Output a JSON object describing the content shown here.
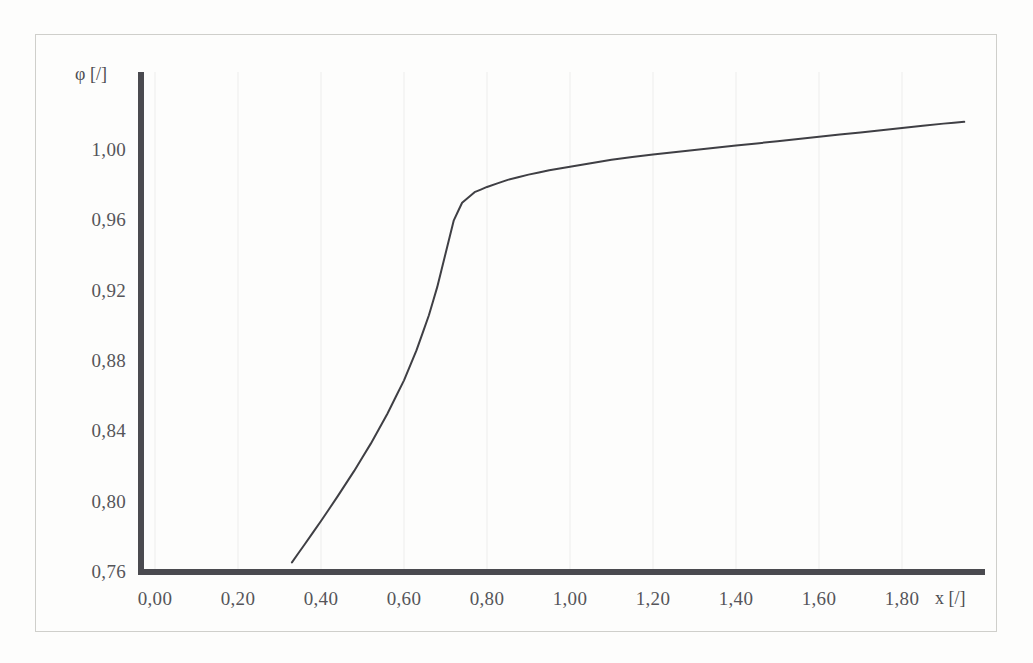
{
  "figure": {
    "background_color": "#fdfdfc",
    "frame_color": "#cfcfcb",
    "axis_color": "#4a4a4f",
    "curve_color": "#3f3f44",
    "gridline_color": "#f0f0ee",
    "tick_label_color": "#55555a"
  },
  "chart_data": {
    "type": "line",
    "title": "",
    "subtitle": "",
    "xlabel": "x [/]",
    "ylabel": "φ [/]",
    "xlim": [
      0.0,
      1.98
    ],
    "ylim": [
      0.76,
      1.025
    ],
    "grid": "vertical-only",
    "legend": "none",
    "x_ticks": [
      0.0,
      0.2,
      0.4,
      0.6,
      0.8,
      1.0,
      1.2,
      1.4,
      1.6,
      1.8
    ],
    "x_tick_labels": [
      "0,00",
      "0,20",
      "0,40",
      "0,60",
      "0,80",
      "1,00",
      "1,20",
      "1,40",
      "1,60",
      "1,80"
    ],
    "y_ticks": [
      0.76,
      0.8,
      0.84,
      0.88,
      0.92,
      0.96,
      1.0
    ],
    "y_tick_labels": [
      "0,76",
      "0,80",
      "0,84",
      "0,88",
      "0,92",
      "0,96",
      "1,00"
    ],
    "series": [
      {
        "name": "phi(x)",
        "color": "#3f3f44",
        "line_width": 2,
        "x": [
          0.33,
          0.36,
          0.4,
          0.44,
          0.48,
          0.52,
          0.56,
          0.6,
          0.63,
          0.66,
          0.68,
          0.7,
          0.72,
          0.74,
          0.77,
          0.8,
          0.85,
          0.9,
          0.95,
          1.0,
          1.1,
          1.2,
          1.3,
          1.4,
          1.5,
          1.6,
          1.7,
          1.8,
          1.9,
          1.95
        ],
        "y": [
          0.7655,
          0.7755,
          0.789,
          0.803,
          0.8175,
          0.833,
          0.85,
          0.869,
          0.886,
          0.906,
          0.922,
          0.941,
          0.96,
          0.97,
          0.976,
          0.979,
          0.983,
          0.986,
          0.9885,
          0.9905,
          0.9945,
          0.9975,
          1.0,
          1.0025,
          1.005,
          1.0075,
          1.01,
          1.0125,
          1.015,
          1.016
        ]
      }
    ],
    "annotations": []
  },
  "axis_titles": {
    "y": "φ [/]",
    "x": "x [/]"
  }
}
